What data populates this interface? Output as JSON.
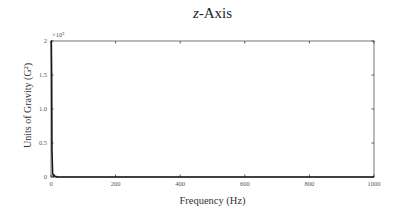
{
  "chart_data": {
    "type": "line",
    "title": "z-Axis",
    "title_italic_part": "z",
    "title_rest": "-Axis",
    "xlabel": "Frequency (Hz)",
    "ylabel": "Units of Gravity (G²)",
    "y_multiplier": "×10⁵",
    "xlim": [
      0,
      1000
    ],
    "ylim": [
      0,
      200000
    ],
    "x_ticks": [
      0,
      200,
      400,
      600,
      800,
      1000
    ],
    "x_tick_labels": [
      "0",
      "200",
      "400",
      "600",
      "800",
      "1000"
    ],
    "y_ticks": [
      0,
      50000,
      100000,
      150000,
      200000
    ],
    "y_tick_labels": [
      "0",
      "0.5",
      "1.0",
      "1.5",
      "2"
    ],
    "grid": false,
    "legend": null,
    "series": [
      {
        "name": "z-Axis PSD",
        "color": "#1a1a1a",
        "x": [
          0,
          1,
          2,
          3,
          5,
          8,
          10,
          12,
          15,
          20,
          50,
          100,
          200,
          400,
          600,
          800,
          1000
        ],
        "y": [
          200000,
          200000,
          150000,
          40000,
          5000,
          1500,
          2500,
          1200,
          500,
          200,
          50,
          20,
          10,
          5,
          5,
          5,
          5
        ]
      }
    ]
  }
}
